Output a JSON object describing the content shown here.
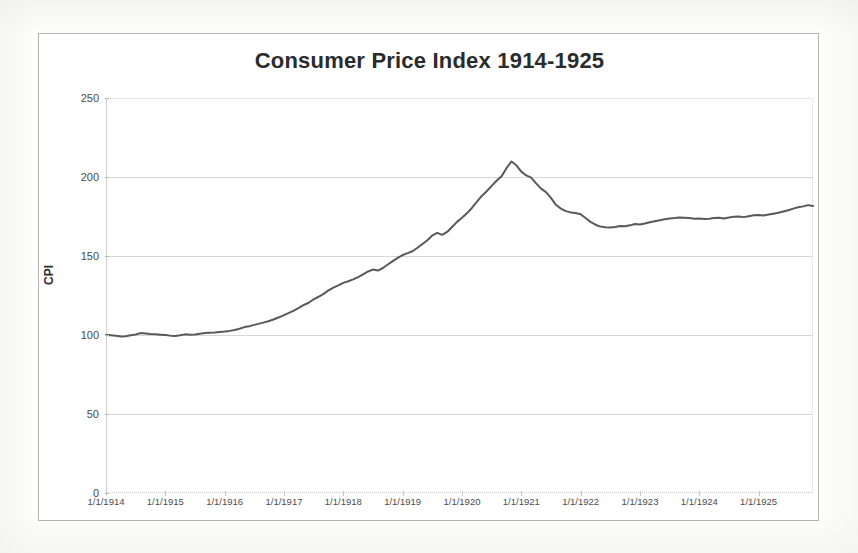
{
  "chart_frame": {
    "border_color": "#b4b4b4",
    "background": "#ffffff"
  },
  "chart_data": {
    "type": "line",
    "title": "Consumer Price Index 1914-1925",
    "xlabel": "",
    "ylabel": "CPI",
    "grid": true,
    "legend_position": "none",
    "series_color": "#595959",
    "line_width": 2,
    "ylim": [
      0,
      250
    ],
    "yticks": [
      0,
      50,
      100,
      150,
      200,
      250
    ],
    "ytick_labels": [
      "0",
      "50",
      "100",
      "150",
      "200",
      "250"
    ],
    "xtick_labels": [
      "1/1/1914",
      "1/1/1915",
      "1/1/1916",
      "1/1/1917",
      "1/1/1918",
      "1/1/1919",
      "1/1/1920",
      "1/1/1921",
      "1/1/1922",
      "1/1/1923",
      "1/1/1924",
      "1/1/1925"
    ],
    "xlim_labels": [
      "1/1/1914",
      "1/1/1925"
    ],
    "x_unit": "month",
    "x_start": "1914-01",
    "x_end": "1925-12",
    "series": [
      {
        "name": "CPI",
        "values": [
          100.0,
          99.8,
          99.5,
          99.0,
          99.2,
          99.8,
          100.3,
          101.2,
          101.0,
          100.6,
          100.4,
          100.2,
          100.0,
          99.6,
          99.4,
          99.8,
          100.4,
          100.2,
          100.3,
          100.8,
          101.2,
          101.4,
          101.6,
          101.9,
          102.2,
          102.6,
          103.2,
          104.0,
          105.0,
          105.6,
          106.4,
          107.2,
          108.0,
          108.9,
          110.0,
          111.2,
          112.6,
          114.0,
          115.4,
          117.2,
          119.0,
          120.4,
          122.6,
          124.2,
          126.0,
          128.2,
          130.0,
          131.4,
          133.0,
          134.0,
          135.2,
          136.6,
          138.4,
          140.2,
          141.4,
          140.8,
          142.4,
          144.6,
          146.8,
          148.8,
          150.6,
          151.8,
          153.0,
          155.2,
          157.6,
          160.0,
          163.0,
          164.6,
          163.4,
          165.2,
          168.4,
          171.6,
          174.2,
          177.0,
          180.4,
          184.2,
          188.0,
          191.0,
          194.4,
          197.6,
          200.4,
          205.6,
          209.8,
          207.4,
          203.4,
          201.0,
          199.6,
          196.0,
          192.6,
          190.4,
          186.8,
          182.4,
          180.0,
          178.4,
          177.6,
          177.2,
          176.4,
          174.0,
          171.6,
          169.8,
          168.6,
          168.2,
          168.0,
          168.4,
          169.0,
          168.8,
          169.4,
          170.2,
          170.0,
          170.6,
          171.4,
          172.0,
          172.6,
          173.2,
          173.8,
          174.0,
          174.4,
          174.2,
          174.0,
          173.6,
          173.8,
          173.4,
          173.6,
          174.0,
          174.2,
          173.8,
          174.4,
          174.8,
          175.0,
          174.6,
          175.2,
          175.8,
          176.0,
          175.6,
          176.2,
          176.8,
          177.4,
          178.2,
          179.0,
          180.0,
          180.8,
          181.4,
          182.2,
          181.6
        ]
      }
    ],
    "annotations": {
      "peak_value": 210,
      "peak_label": "mid-1920",
      "trough_value": 168,
      "trough_label": "1922"
    }
  }
}
